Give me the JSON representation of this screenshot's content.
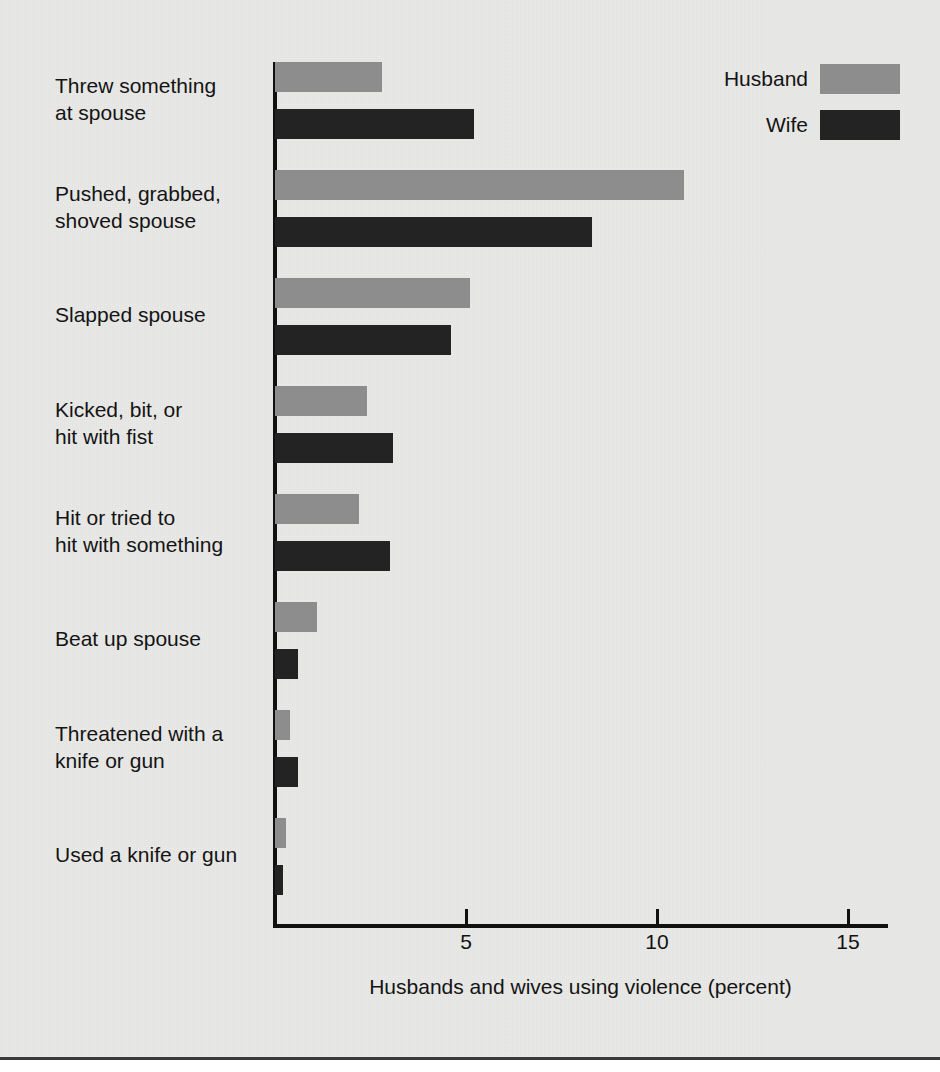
{
  "chart_data": {
    "type": "bar",
    "orientation": "horizontal",
    "title": "",
    "xlabel": "Husbands and wives using violence (percent)",
    "ylabel": "",
    "xlim": [
      0,
      16.1
    ],
    "xticks": [
      5,
      10,
      15
    ],
    "xtick_labels": [
      "5",
      "10",
      "15"
    ],
    "grid": false,
    "legend_position": "top-right",
    "categories": [
      "Threw something\nat spouse",
      "Pushed, grabbed,\nshoved spouse",
      "Slapped spouse",
      "Kicked, bit, or\nhit with fist",
      "Hit or tried to\nhit with something",
      "Beat up spouse",
      "Threatened with a\nknife or gun",
      "Used a knife or gun"
    ],
    "series": [
      {
        "name": "Husband",
        "color": "#8d8d8d",
        "values": [
          2.8,
          10.7,
          5.1,
          2.4,
          2.2,
          1.1,
          0.4,
          0.3
        ]
      },
      {
        "name": "Wife",
        "color": "#232323",
        "values": [
          5.2,
          8.3,
          4.6,
          3.1,
          3.0,
          0.6,
          0.6,
          0.2
        ]
      }
    ]
  },
  "legend": {
    "items": [
      {
        "label": "Husband",
        "color": "#8d8d8d"
      },
      {
        "label": "Wife",
        "color": "#232323"
      }
    ]
  },
  "axis": {
    "x_title": "Husbands and wives using violence (percent)",
    "tick_labels": [
      "5",
      "10",
      "15"
    ]
  },
  "colors": {
    "background": "#e9e9e7",
    "husband": "#8d8d8d",
    "wife": "#232323",
    "axis": "#111111",
    "text": "#141414"
  }
}
